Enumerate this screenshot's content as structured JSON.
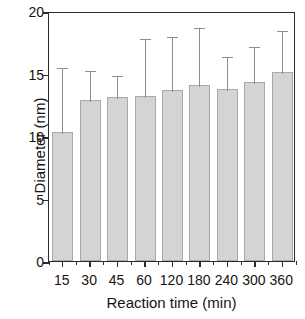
{
  "chart_data": {
    "type": "bar",
    "title": "",
    "xlabel": "Reaction time (min)",
    "ylabel": "Diameter (nm)",
    "categories": [
      "15",
      "30",
      "45",
      "60",
      "120",
      "180",
      "240",
      "300",
      "360"
    ],
    "values": [
      10.3,
      12.9,
      13.1,
      13.2,
      13.7,
      14.1,
      13.8,
      14.3,
      15.1
    ],
    "error_upper": [
      15.6,
      15.4,
      15.0,
      17.9,
      18.1,
      18.8,
      16.5,
      17.3,
      18.6
    ],
    "errors": [
      5.3,
      2.5,
      1.9,
      4.7,
      4.4,
      4.7,
      2.7,
      3.0,
      3.5
    ],
    "ylim": [
      0,
      20
    ],
    "yticks": [
      "0",
      "5",
      "10",
      "15",
      "20"
    ],
    "ytick_values": [
      0,
      5,
      10,
      15,
      20
    ],
    "grid": false,
    "legend": "none",
    "bar_color": "#d4d4d4",
    "bar_edge_color": "#a8a8a8",
    "error_color": "#8e8e8e",
    "axis_color": "#2b2b2b"
  },
  "axes": {
    "x_title": "Reaction time (min)",
    "y_title": "Diameter (nm)"
  }
}
